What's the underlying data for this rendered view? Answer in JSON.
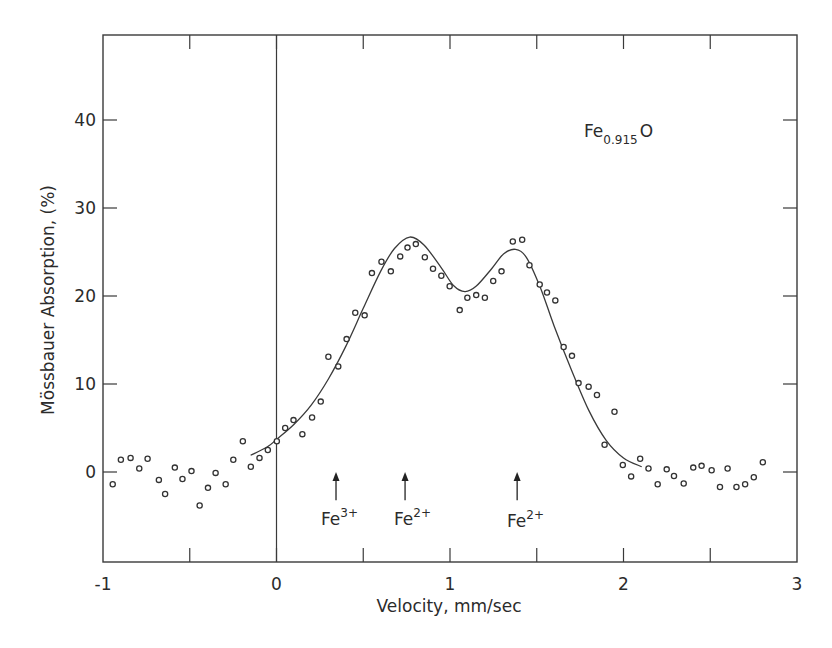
{
  "chart_data": {
    "type": "scatter",
    "title": "",
    "xlabel": "Velocity, mm/sec",
    "ylabel": "Mössbauer Absorption, (%)",
    "xlim": [
      -1,
      3
    ],
    "ylim": [
      -10,
      50
    ],
    "x_ticks": [
      -1,
      0,
      1,
      2,
      3
    ],
    "x_tick_labels": [
      "-1",
      "0",
      "1",
      "2",
      "3"
    ],
    "x_minor_ticks": [
      -0.5,
      0.5,
      1.5,
      2.5
    ],
    "y_ticks": [
      0,
      10,
      20,
      30,
      40
    ],
    "y_tick_labels": [
      "0",
      "10",
      "20",
      "30",
      "40"
    ],
    "grid": false,
    "legend": null,
    "vertical_reference_line_x": 0,
    "series": [
      {
        "name": "Measured data",
        "style": "open-circle markers",
        "points": [
          [
            -0.944,
            -1.4
          ],
          [
            -0.897,
            1.4
          ],
          [
            -0.841,
            1.6
          ],
          [
            -0.791,
            0.4
          ],
          [
            -0.743,
            1.5
          ],
          [
            -0.678,
            -0.9
          ],
          [
            -0.642,
            -2.5
          ],
          [
            -0.586,
            0.5
          ],
          [
            -0.542,
            -0.8
          ],
          [
            -0.49,
            0.1
          ],
          [
            -0.443,
            -3.8
          ],
          [
            -0.395,
            -1.8
          ],
          [
            -0.351,
            -0.1
          ],
          [
            -0.293,
            -1.4
          ],
          [
            -0.249,
            1.4
          ],
          [
            -0.194,
            3.5
          ],
          [
            -0.148,
            0.6
          ],
          [
            -0.098,
            1.6
          ],
          [
            -0.05,
            2.5
          ],
          [
            0.002,
            3.5
          ],
          [
            0.05,
            5.0
          ],
          [
            0.098,
            5.9
          ],
          [
            0.149,
            4.3
          ],
          [
            0.205,
            6.2
          ],
          [
            0.255,
            8.0
          ],
          [
            0.299,
            13.1
          ],
          [
            0.356,
            12.0
          ],
          [
            0.404,
            15.1
          ],
          [
            0.454,
            18.1
          ],
          [
            0.508,
            17.8
          ],
          [
            0.55,
            22.6
          ],
          [
            0.605,
            23.9
          ],
          [
            0.659,
            22.8
          ],
          [
            0.713,
            24.5
          ],
          [
            0.755,
            25.5
          ],
          [
            0.803,
            25.9
          ],
          [
            0.855,
            24.4
          ],
          [
            0.902,
            23.1
          ],
          [
            0.95,
            22.3
          ],
          [
            0.998,
            21.1
          ],
          [
            1.056,
            18.4
          ],
          [
            1.1,
            19.8
          ],
          [
            1.151,
            20.1
          ],
          [
            1.201,
            19.8
          ],
          [
            1.249,
            21.7
          ],
          [
            1.297,
            22.8
          ],
          [
            1.362,
            26.2
          ],
          [
            1.416,
            26.4
          ],
          [
            1.458,
            23.5
          ],
          [
            1.517,
            21.3
          ],
          [
            1.559,
            20.4
          ],
          [
            1.607,
            19.5
          ],
          [
            1.655,
            14.2
          ],
          [
            1.703,
            13.2
          ],
          [
            1.741,
            10.1
          ],
          [
            1.799,
            9.7
          ],
          [
            1.847,
            8.75
          ],
          [
            1.891,
            3.1
          ],
          [
            1.948,
            6.85
          ],
          [
            1.996,
            0.8
          ],
          [
            2.044,
            -0.5
          ],
          [
            2.096,
            1.5
          ],
          [
            2.144,
            0.4
          ],
          [
            2.197,
            -1.4
          ],
          [
            2.249,
            0.3
          ],
          [
            2.291,
            -0.45
          ],
          [
            2.347,
            -1.3
          ],
          [
            2.402,
            0.5
          ],
          [
            2.45,
            0.7
          ],
          [
            2.508,
            0.2
          ],
          [
            2.556,
            -1.7
          ],
          [
            2.6,
            0.4
          ],
          [
            2.651,
            -1.7
          ],
          [
            2.701,
            -1.4
          ],
          [
            2.751,
            -0.6
          ],
          [
            2.803,
            1.1
          ]
        ]
      },
      {
        "name": "Fitted curve",
        "style": "solid line",
        "points": [
          [
            -0.149,
            1.9
          ],
          [
            -0.05,
            2.9
          ],
          [
            0.0,
            3.7
          ],
          [
            0.1,
            5.4
          ],
          [
            0.2,
            7.6
          ],
          [
            0.3,
            10.6
          ],
          [
            0.4,
            14.3
          ],
          [
            0.5,
            18.6
          ],
          [
            0.6,
            22.8
          ],
          [
            0.68,
            25.4
          ],
          [
            0.768,
            26.7
          ],
          [
            0.85,
            25.8
          ],
          [
            0.95,
            23.2
          ],
          [
            1.02,
            21.2
          ],
          [
            1.086,
            20.5
          ],
          [
            1.15,
            21.1
          ],
          [
            1.24,
            23.1
          ],
          [
            1.31,
            24.8
          ],
          [
            1.378,
            25.3
          ],
          [
            1.44,
            24.4
          ],
          [
            1.52,
            21.0
          ],
          [
            1.6,
            16.6
          ],
          [
            1.7,
            11.6
          ],
          [
            1.8,
            7.0
          ],
          [
            1.9,
            3.6
          ],
          [
            2.0,
            1.6
          ],
          [
            2.105,
            0.6
          ]
        ]
      }
    ],
    "annotations": [
      {
        "text": "Fe0.915O",
        "base": "Fe",
        "subscript": "0.915",
        "suffix": "O",
        "x": 1.9,
        "y": 36.2
      },
      {
        "text": "Fe3+",
        "base": "Fe",
        "superscript": "3+",
        "arrow_x": 0.343
      },
      {
        "text": "Fe2+",
        "base": "Fe",
        "superscript": "2+",
        "arrow_x": 0.741
      },
      {
        "text": "Fe2+",
        "base": "Fe",
        "superscript": "2+",
        "arrow_x": 1.387
      }
    ],
    "peak_markers": {
      "arrow_tip_y": 0.0,
      "arrow_tail_y": -3.2
    }
  },
  "labels": {
    "xlabel": "Velocity, mm/sec",
    "ylabel": "Mössbauer Absorption, (%)",
    "compound_base": "Fe",
    "compound_sub": "0.915",
    "compound_suffix": "O",
    "ion1_base": "Fe",
    "ion1_sup": "3+",
    "ion2_base": "Fe",
    "ion2_sup": "2+",
    "ion3_base": "Fe",
    "ion3_sup": "2+"
  }
}
